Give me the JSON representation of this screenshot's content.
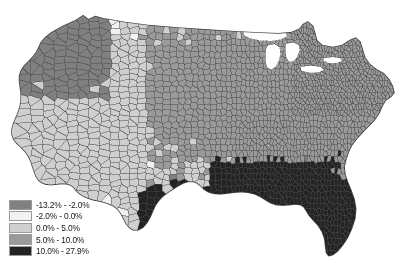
{
  "figure": {
    "type": "choropleth-map",
    "region": "Contiguous United States",
    "geography_level": "county",
    "background_color": "#ffffff",
    "has_title": false,
    "has_axes": false,
    "water_color": "#ffffff",
    "border_color": "#4a4a4a"
  },
  "legend": {
    "position": "bottom-left",
    "orientation": "vertical",
    "classes": [
      {
        "label": "-13.2% - -2.0%",
        "color": "#808080",
        "min": -13.2,
        "max": -2.0
      },
      {
        "label": "-2.0% - 0.0%",
        "color": "#f2f2f2",
        "min": -2.0,
        "max": 0.0
      },
      {
        "label": "0.0% - 5.0%",
        "color": "#cfcfcf",
        "min": 0.0,
        "max": 5.0
      },
      {
        "label": "5.0% - 10.0%",
        "color": "#9a9a9a",
        "min": 5.0,
        "max": 10.0
      },
      {
        "label": "10.0% - 27.9%",
        "color": "#232323",
        "min": 10.0,
        "max": 27.9
      }
    ]
  },
  "chart_data": {
    "type": "heatmap",
    "title": "",
    "subtitle": "",
    "xlabel": "",
    "ylabel": "",
    "units": "percent",
    "value_range": [
      -13.2,
      27.9
    ],
    "legend_position": "bottom-left",
    "grid": false,
    "class_breaks": [
      -13.2,
      -2.0,
      0.0,
      5.0,
      10.0,
      27.9
    ],
    "class_colors": [
      "#808080",
      "#f2f2f2",
      "#cfcfcf",
      "#9a9a9a",
      "#232323"
    ],
    "regional_pattern": [
      {
        "region": "Deep South (AL, MS, LA, GA)",
        "dominant_class": 4,
        "note": "darkest, highest values"
      },
      {
        "region": "Florida",
        "dominant_class": 4,
        "note": "near-solid darkest class"
      },
      {
        "region": "South Texas / Gulf Coast",
        "dominant_class": 4,
        "note": "darkest class"
      },
      {
        "region": "Great Plains (KS, NE, IA, SD, ND)",
        "dominant_class": 3,
        "note": "dense mid-gray grid"
      },
      {
        "region": "Midwest / Ohio Valley",
        "dominant_class": 3,
        "note": "mid-gray"
      },
      {
        "region": "Northeast",
        "dominant_class": 3,
        "note": "dense small mid-gray counties"
      },
      {
        "region": "Mountain West",
        "dominant_class": 2,
        "note": "large light counties"
      },
      {
        "region": "California / Nevada",
        "dominant_class": 2,
        "note": "light to medium"
      },
      {
        "region": "Pacific Northwest",
        "dominant_class": 0,
        "note": "mixed medium-dark and light"
      },
      {
        "region": "Great Lakes",
        "dominant_class": -1,
        "note": "water, rendered white"
      }
    ]
  }
}
